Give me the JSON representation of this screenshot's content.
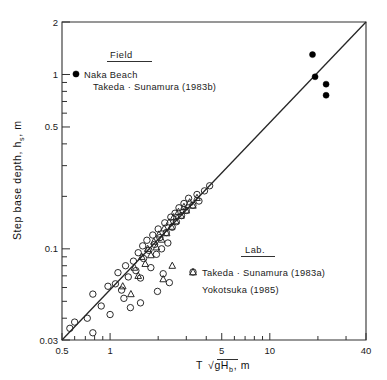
{
  "chart_data": {
    "type": "scatter",
    "title": "",
    "xlabel": "T √gHₕ , m",
    "xlabel_parts": {
      "prefix": "T",
      "radical": "√",
      "radicand_main": "gH",
      "radicand_sub": "b",
      "suffix": ", m"
    },
    "ylabel": "Step base depth, hₛ, m",
    "ylabel_parts": {
      "main": "Step base depth, h",
      "sub": "s",
      "suffix": ", m"
    },
    "xscale": "log",
    "yscale": "log",
    "xlim": [
      0.5,
      40
    ],
    "ylim": [
      0.03,
      2
    ],
    "grid": false,
    "xticks_labeled": [
      {
        "value": 0.5,
        "label": "0.5"
      },
      {
        "value": 1,
        "label": "1"
      },
      {
        "value": 5,
        "label": "5"
      },
      {
        "value": 10,
        "label": "10"
      },
      {
        "value": 40,
        "label": "40"
      }
    ],
    "xticks_minor": [
      0.6,
      0.7,
      0.8,
      0.9,
      2,
      3,
      4,
      6,
      7,
      8,
      9,
      20,
      30
    ],
    "yticks_labeled": [
      {
        "value": 0.03,
        "label": "0.03"
      },
      {
        "value": 0.1,
        "label": "0.1"
      },
      {
        "value": 0.5,
        "label": "0.5"
      },
      {
        "value": 1,
        "label": "1"
      },
      {
        "value": 2,
        "label": "2"
      }
    ],
    "yticks_minor": [
      0.04,
      0.05,
      0.06,
      0.07,
      0.08,
      0.09,
      0.2,
      0.3,
      0.4,
      0.6,
      0.7,
      0.8,
      0.9
    ],
    "reference_line": {
      "from": [
        0.5,
        0.03
      ],
      "to": [
        40,
        2.0
      ],
      "style": "solid",
      "color": "#262626"
    },
    "legend_position": "inside-top-left and inside-bottom-right",
    "series": [
      {
        "name": "Naka Beach Takeda · Sunamura (1983b)",
        "group": "Field",
        "marker": "filled-circle",
        "points": [
          [
            18.5,
            1.3
          ],
          [
            19.2,
            0.97
          ],
          [
            22.5,
            0.88
          ],
          [
            22.5,
            0.76
          ]
        ]
      },
      {
        "name": "Takeda · Sunamura (1983a)",
        "group": "Lab.",
        "marker": "open-circle",
        "points": [
          [
            0.56,
            0.035
          ],
          [
            0.6,
            0.038
          ],
          [
            0.72,
            0.04
          ],
          [
            0.78,
            0.033
          ],
          [
            0.78,
            0.055
          ],
          [
            0.88,
            0.047
          ],
          [
            0.97,
            0.061
          ],
          [
            1.0,
            0.042
          ],
          [
            1.08,
            0.063
          ],
          [
            1.12,
            0.073
          ],
          [
            1.18,
            0.058
          ],
          [
            1.22,
            0.052
          ],
          [
            1.25,
            0.08
          ],
          [
            1.3,
            0.069
          ],
          [
            1.34,
            0.046
          ],
          [
            1.4,
            0.085
          ],
          [
            1.45,
            0.075
          ],
          [
            1.5,
            0.095
          ],
          [
            1.55,
            0.068
          ],
          [
            1.6,
            0.104
          ],
          [
            1.62,
            0.088
          ],
          [
            1.7,
            0.112
          ],
          [
            1.75,
            0.098
          ],
          [
            1.8,
            0.078
          ],
          [
            1.85,
            0.12
          ],
          [
            1.9,
            0.106
          ],
          [
            1.95,
            0.093
          ],
          [
            2.0,
            0.13
          ],
          [
            2.05,
            0.116
          ],
          [
            2.1,
            0.1
          ],
          [
            2.2,
            0.141
          ],
          [
            2.25,
            0.124
          ],
          [
            2.3,
            0.108
          ],
          [
            2.4,
            0.152
          ],
          [
            2.45,
            0.133
          ],
          [
            2.55,
            0.16
          ],
          [
            2.6,
            0.143
          ],
          [
            2.7,
            0.172
          ],
          [
            2.8,
            0.155
          ],
          [
            2.9,
            0.182
          ],
          [
            3.0,
            0.166
          ],
          [
            3.1,
            0.195
          ],
          [
            3.3,
            0.178
          ],
          [
            3.5,
            0.205
          ],
          [
            3.6,
            0.188
          ],
          [
            3.9,
            0.215
          ],
          [
            4.2,
            0.23
          ],
          [
            2.15,
            0.072
          ],
          [
            2.35,
            0.064
          ],
          [
            1.55,
            0.049
          ],
          [
            1.98,
            0.057
          ]
        ]
      },
      {
        "name": "Yokotsuka (1985)",
        "group": "Lab.",
        "marker": "open-triangle",
        "points": [
          [
            1.2,
            0.061
          ],
          [
            1.42,
            0.078
          ],
          [
            1.5,
            0.07
          ],
          [
            1.58,
            0.09
          ],
          [
            1.66,
            0.082
          ],
          [
            1.72,
            0.1
          ],
          [
            1.8,
            0.092
          ],
          [
            1.88,
            0.11
          ],
          [
            1.95,
            0.102
          ],
          [
            2.02,
            0.121
          ],
          [
            2.1,
            0.113
          ],
          [
            2.18,
            0.131
          ],
          [
            2.26,
            0.123
          ],
          [
            2.34,
            0.142
          ],
          [
            2.42,
            0.134
          ],
          [
            2.5,
            0.152
          ],
          [
            2.58,
            0.144
          ],
          [
            2.68,
            0.163
          ],
          [
            2.78,
            0.155
          ],
          [
            2.9,
            0.174
          ],
          [
            3.0,
            0.166
          ],
          [
            3.15,
            0.185
          ],
          [
            3.3,
            0.177
          ],
          [
            3.5,
            0.196
          ],
          [
            2.15,
            0.067
          ],
          [
            2.45,
            0.08
          ],
          [
            1.35,
            0.055
          ]
        ]
      }
    ]
  },
  "legend_field": {
    "header": "Field",
    "entries": [
      {
        "marker": "filled-circle",
        "line1": "Naka  Beach",
        "line2": "Takeda · Sunamura  (1983b)"
      }
    ]
  },
  "legend_lab": {
    "header": "Lab.",
    "entries": [
      {
        "marker": "open-circle",
        "label": "Takeda · Sunamura  (1983a)"
      },
      {
        "marker": "open-triangle",
        "label": "Yokotsuka  (1985)"
      }
    ]
  },
  "colors": {
    "frame": "#303030",
    "line": "#262626",
    "marker_stroke": "#202020",
    "marker_fill": "#000000",
    "text": "#1a1a1a",
    "background": "#ffffff"
  }
}
